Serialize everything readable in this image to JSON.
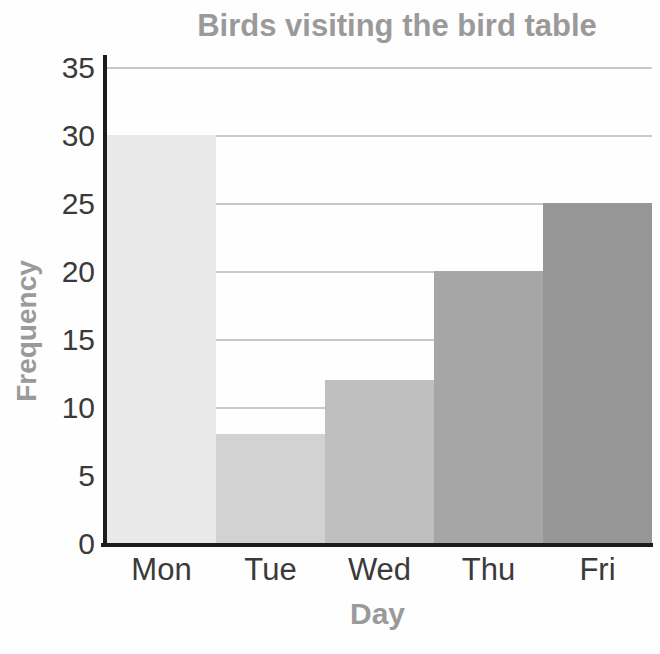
{
  "chart_data": {
    "type": "bar",
    "title": "Birds visiting the bird table",
    "xlabel": "Day",
    "ylabel": "Frequency",
    "categories": [
      "Mon",
      "Tue",
      "Wed",
      "Thu",
      "Fri"
    ],
    "values": [
      30,
      8,
      12,
      20,
      25
    ],
    "bar_colors": [
      "#e9e9e9",
      "#d2d2d2",
      "#bfbfbf",
      "#a6a6a6",
      "#969696"
    ],
    "ylim": [
      0,
      35
    ],
    "yticks": [
      0,
      5,
      10,
      15,
      20,
      25,
      30,
      35
    ],
    "grid": "horizontal gridlines at each y tick, drawn behind bars",
    "legend": "none",
    "colors": {
      "heading_text": "#9a9a9a",
      "tick_text": "#3a3a3a",
      "axis_line": "#1c1c1c",
      "gridline": "#c9c9c9",
      "background": "#fefefe"
    }
  }
}
